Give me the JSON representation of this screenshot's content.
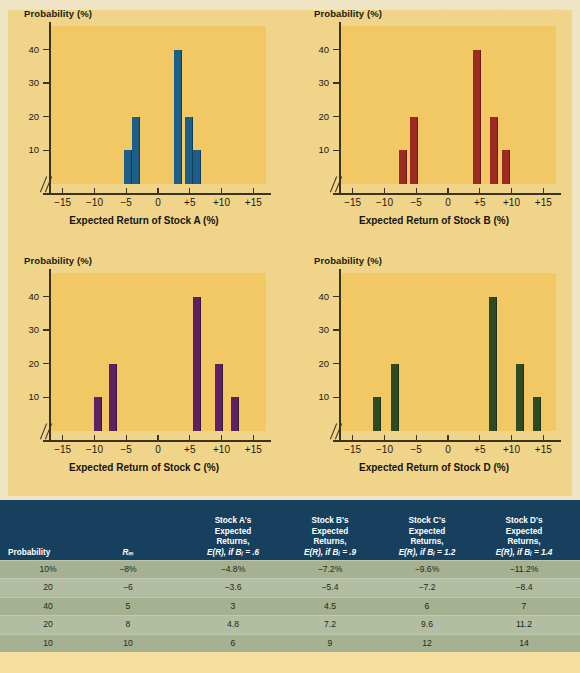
{
  "charts": [
    {
      "id": "stock-a",
      "ylabel": "Probability (%)",
      "xlabel": "Expected Return of Stock A (%)",
      "color": "#1d5f88",
      "yticks": [
        10,
        20,
        30,
        40
      ],
      "xticks": [
        "−15",
        "−10",
        "−5",
        "0",
        "+5",
        "+10",
        "+15"
      ],
      "xtickvals": [
        -15,
        -10,
        -5,
        0,
        5,
        10,
        15
      ],
      "chart_data": {
        "type": "bar",
        "title": "",
        "xlabel": "Expected Return of Stock A (%)",
        "ylabel": "Probability (%)",
        "x": [
          -4.8,
          -3.6,
          3,
          4.8,
          6
        ],
        "values": [
          10,
          20,
          40,
          20,
          10
        ],
        "xlim": [
          -17,
          17
        ],
        "ylim": [
          0,
          47
        ],
        "grid": false,
        "legend": "none"
      }
    },
    {
      "id": "stock-b",
      "ylabel": "Probability (%)",
      "xlabel": "Expected Return of Stock B (%)",
      "color": "#9c2b22",
      "yticks": [
        10,
        20,
        30,
        40
      ],
      "xticks": [
        "−15",
        "−10",
        "−5",
        "0",
        "+5",
        "+10",
        "+15"
      ],
      "xtickvals": [
        -15,
        -10,
        -5,
        0,
        5,
        10,
        15
      ],
      "chart_data": {
        "type": "bar",
        "title": "",
        "xlabel": "Expected Return of Stock B (%)",
        "ylabel": "Probability (%)",
        "x": [
          -7.2,
          -5.4,
          4.5,
          7.2,
          9
        ],
        "values": [
          10,
          20,
          40,
          20,
          10
        ],
        "xlim": [
          -17,
          17
        ],
        "ylim": [
          0,
          47
        ],
        "grid": false,
        "legend": "none"
      }
    },
    {
      "id": "stock-c",
      "ylabel": "Probability (%)",
      "xlabel": "Expected Return of Stock C (%)",
      "color": "#5b2162",
      "yticks": [
        10,
        20,
        30,
        40
      ],
      "xticks": [
        "−15",
        "−10",
        "−5",
        "0",
        "+5",
        "+10",
        "+15"
      ],
      "xtickvals": [
        -15,
        -10,
        -5,
        0,
        5,
        10,
        15
      ],
      "chart_data": {
        "type": "bar",
        "title": "",
        "xlabel": "Expected Return of Stock C (%)",
        "ylabel": "Probability (%)",
        "x": [
          -9.6,
          -7.2,
          6,
          9.6,
          12
        ],
        "values": [
          10,
          20,
          40,
          20,
          10
        ],
        "xlim": [
          -17,
          17
        ],
        "ylim": [
          0,
          47
        ],
        "grid": false,
        "legend": "none"
      }
    },
    {
      "id": "stock-d",
      "ylabel": "Probability (%)",
      "xlabel": "Expected Return of Stock D (%)",
      "color": "#2e4a21",
      "yticks": [
        10,
        20,
        30,
        40
      ],
      "xticks": [
        "−15",
        "−10",
        "−5",
        "0",
        "+5",
        "+10",
        "+15"
      ],
      "xtickvals": [
        -15,
        -10,
        -5,
        0,
        5,
        10,
        15
      ],
      "chart_data": {
        "type": "bar",
        "title": "",
        "xlabel": "Expected Return of Stock D (%)",
        "ylabel": "Probability (%)",
        "x": [
          -11.2,
          -8.4,
          7,
          11.2,
          14
        ],
        "values": [
          10,
          20,
          40,
          20,
          10
        ],
        "xlim": [
          -17,
          17
        ],
        "ylim": [
          0,
          47
        ],
        "grid": false,
        "legend": "none"
      }
    }
  ],
  "table": {
    "header_bg": "#17405f",
    "body_bg": "#aab597",
    "columns": [
      {
        "key": "probability",
        "lines": [
          "Probability"
        ],
        "align": "left"
      },
      {
        "key": "rm",
        "lines": [
          "Rₘ"
        ],
        "align": "center"
      },
      {
        "key": "a",
        "lines": [
          "Stock A's",
          "Expected",
          "Returns,",
          "E(R), if Bᵢ = .6"
        ],
        "align": "center"
      },
      {
        "key": "b",
        "lines": [
          "Stock B's",
          "Expected",
          "Returns,",
          "E(R), if Bᵢ = .9"
        ],
        "align": "center"
      },
      {
        "key": "c",
        "lines": [
          "Stock C's",
          "Expected",
          "Returns,",
          "E(R), if Bᵢ = 1.2"
        ],
        "align": "center"
      },
      {
        "key": "d",
        "lines": [
          "Stock D's",
          "Expected",
          "Returns,",
          "E(R), if Bᵢ = 1.4"
        ],
        "align": "center"
      }
    ],
    "rows": [
      [
        "10%",
        "−8%",
        "−4.8%",
        "−7.2%",
        "−9.6%",
        "−11.2%"
      ],
      [
        "20",
        "−6",
        "−3.6",
        "−5.4",
        "−7.2",
        "−8.4"
      ],
      [
        "40",
        "5",
        "3",
        "4.5",
        "6",
        "7"
      ],
      [
        "20",
        "8",
        "4.8",
        "7.2",
        "9.6",
        "11.2"
      ],
      [
        "10",
        "10",
        "6",
        "9",
        "12",
        "14"
      ]
    ]
  },
  "chart_data": [
    {
      "type": "bar",
      "title": "Expected Return of Stock A (%)",
      "xlabel": "Expected Return of Stock A (%)",
      "ylabel": "Probability (%)",
      "x": [
        -4.8,
        -3.6,
        3,
        4.8,
        6
      ],
      "values": [
        10,
        20,
        40,
        20,
        10
      ],
      "categories": [
        "-4.8",
        "-3.6",
        "3",
        "4.8",
        "6"
      ],
      "xlim": [
        -17,
        17
      ],
      "ylim": [
        0,
        47
      ],
      "yticks": [
        10,
        20,
        30,
        40
      ],
      "xticks": [
        -15,
        -10,
        -5,
        0,
        5,
        10,
        15
      ],
      "grid": false,
      "legend": "none",
      "color": "#1d5f88"
    },
    {
      "type": "bar",
      "title": "Expected Return of Stock B (%)",
      "xlabel": "Expected Return of Stock B (%)",
      "ylabel": "Probability (%)",
      "x": [
        -7.2,
        -5.4,
        4.5,
        7.2,
        9
      ],
      "values": [
        10,
        20,
        40,
        20,
        10
      ],
      "categories": [
        "-7.2",
        "-5.4",
        "4.5",
        "7.2",
        "9"
      ],
      "xlim": [
        -17,
        17
      ],
      "ylim": [
        0,
        47
      ],
      "yticks": [
        10,
        20,
        30,
        40
      ],
      "xticks": [
        -15,
        -10,
        -5,
        0,
        5,
        10,
        15
      ],
      "grid": false,
      "legend": "none",
      "color": "#9c2b22"
    },
    {
      "type": "bar",
      "title": "Expected Return of Stock C (%)",
      "xlabel": "Expected Return of Stock C (%)",
      "ylabel": "Probability (%)",
      "x": [
        -9.6,
        -7.2,
        6,
        9.6,
        12
      ],
      "values": [
        10,
        20,
        40,
        20,
        10
      ],
      "categories": [
        "-9.6",
        "-7.2",
        "6",
        "9.6",
        "12"
      ],
      "xlim": [
        -17,
        17
      ],
      "ylim": [
        0,
        47
      ],
      "yticks": [
        10,
        20,
        30,
        40
      ],
      "xticks": [
        -15,
        -10,
        -5,
        0,
        5,
        10,
        15
      ],
      "grid": false,
      "legend": "none",
      "color": "#5b2162"
    },
    {
      "type": "bar",
      "title": "Expected Return of Stock D (%)",
      "xlabel": "Expected Return of Stock D (%)",
      "ylabel": "Probability (%)",
      "x": [
        -11.2,
        -8.4,
        7,
        11.2,
        14
      ],
      "values": [
        10,
        20,
        40,
        20,
        10
      ],
      "categories": [
        "-11.2",
        "-8.4",
        "7",
        "11.2",
        "14"
      ],
      "xlim": [
        -17,
        17
      ],
      "ylim": [
        0,
        47
      ],
      "yticks": [
        10,
        20,
        30,
        40
      ],
      "xticks": [
        -15,
        -10,
        -5,
        0,
        5,
        10,
        15
      ],
      "grid": false,
      "legend": "none",
      "color": "#2e4a21"
    }
  ],
  "ghost_text": "the text that was omitted entirely because the rate in question is the expected return and the risk premium is based on the beta of the security. The value of the expected return will change over time. Expected return is the amount an investor anticipates receiving during a holding period. It is calculated by multiplying potential outcomes by the chances of them occurring and then totaling these results. The security market line reflects the required return for a given level of systematic risk measured by beta. Portfolios are evaluated in the same manner as individual securities."
}
